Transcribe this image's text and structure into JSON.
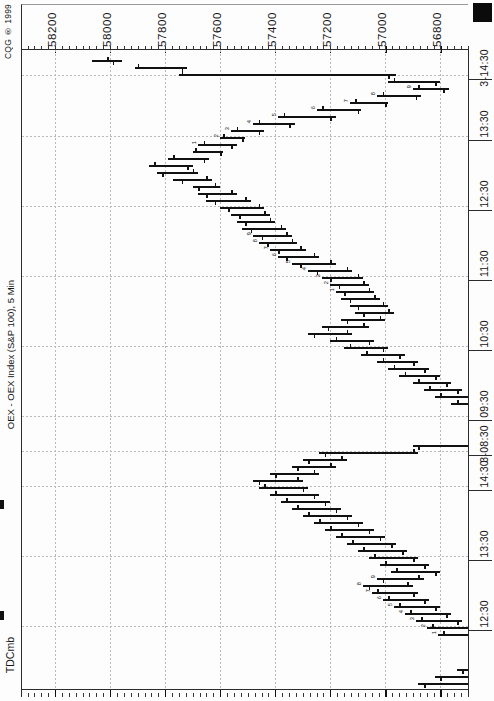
{
  "window": {
    "copyright": "CQG ® 1999",
    "series_label": "OEX - OEX Index (S&P 100), 5 Min",
    "study_label": "TDCmb",
    "corner_marker": "black-square-marker"
  },
  "chart_data": {
    "type": "bar",
    "subtype": "ohlc-bar-chart-rotated-90",
    "title": "OEX - OEX Index (S&P 100), 5 Min",
    "xlabel": "",
    "ylabel": "",
    "grid": true,
    "legend": "none",
    "orientation": "horizontal-price-axis-top",
    "price_axis": {
      "labels": [
        "58200",
        "58000",
        "57800",
        "57600",
        "57400",
        "57200",
        "57000",
        "56800"
      ],
      "values": [
        58200,
        58000,
        57800,
        57600,
        57400,
        57200,
        57000,
        56800
      ],
      "positions_px": [
        45,
        100,
        155,
        210,
        265,
        320,
        375,
        430
      ],
      "range": [
        56700,
        58320
      ],
      "minor_tick_interval": 25
    },
    "time_axis": {
      "labels": [
        "12:30",
        "13:30",
        "14:30",
        "3-08:30",
        "09:30",
        "10:30",
        "11:30",
        "12:30",
        "13:30",
        "3-14:30"
      ],
      "positions_px": [
        626,
        556,
        486,
        451,
        416,
        346,
        276,
        206,
        136,
        75
      ],
      "direction": "bottom-to-top"
    },
    "bars": [
      {
        "t": 60,
        "high": 58065,
        "low": 57955,
        "open": 58010,
        "close": 57990,
        "count": ""
      },
      {
        "t": 67,
        "high": 57910,
        "low": 57720,
        "open": 57900,
        "close": 57740,
        "count": ""
      },
      {
        "t": 74,
        "high": 57750,
        "low": 56960,
        "open": 57740,
        "close": 56990,
        "count": ""
      },
      {
        "t": 81,
        "high": 56990,
        "low": 56800,
        "open": 56970,
        "close": 56820,
        "count": ""
      },
      {
        "t": 88,
        "high": 56900,
        "low": 56770,
        "open": 56880,
        "close": 56790,
        "count": "9"
      },
      {
        "t": 95,
        "high": 57030,
        "low": 56870,
        "open": 57010,
        "close": 56890,
        "count": "8"
      },
      {
        "t": 102,
        "high": 57130,
        "low": 56990,
        "open": 57110,
        "close": 57000,
        "count": "7"
      },
      {
        "t": 109,
        "high": 57250,
        "low": 57090,
        "open": 57230,
        "close": 57100,
        "count": "6"
      },
      {
        "t": 116,
        "high": 57390,
        "low": 57180,
        "open": 57370,
        "close": 57200,
        "count": "5"
      },
      {
        "t": 123,
        "high": 57480,
        "low": 57330,
        "open": 57460,
        "close": 57350,
        "count": "4"
      },
      {
        "t": 130,
        "high": 57560,
        "low": 57440,
        "open": 57540,
        "close": 57460,
        "count": "3"
      },
      {
        "t": 137,
        "high": 57600,
        "low": 57510,
        "open": 57590,
        "close": 57520,
        "count": "2"
      },
      {
        "t": 144,
        "high": 57680,
        "low": 57540,
        "open": 57660,
        "close": 57560,
        "count": "1"
      },
      {
        "t": 151,
        "high": 57700,
        "low": 57590,
        "open": 57690,
        "close": 57600,
        "count": ""
      },
      {
        "t": 158,
        "high": 57790,
        "low": 57640,
        "open": 57770,
        "close": 57660,
        "count": ""
      },
      {
        "t": 165,
        "high": 57860,
        "low": 57700,
        "open": 57840,
        "close": 57720,
        "count": ""
      },
      {
        "t": 172,
        "high": 57830,
        "low": 57680,
        "open": 57700,
        "close": 57810,
        "count": ""
      },
      {
        "t": 179,
        "high": 57770,
        "low": 57630,
        "open": 57650,
        "close": 57740,
        "count": ""
      },
      {
        "t": 186,
        "high": 57700,
        "low": 57600,
        "open": 57620,
        "close": 57680,
        "count": ""
      },
      {
        "t": 193,
        "high": 57680,
        "low": 57540,
        "open": 57560,
        "close": 57650,
        "count": ""
      },
      {
        "t": 200,
        "high": 57650,
        "low": 57490,
        "open": 57510,
        "close": 57620,
        "count": ""
      },
      {
        "t": 207,
        "high": 57600,
        "low": 57440,
        "open": 57460,
        "close": 57570,
        "count": ""
      },
      {
        "t": 214,
        "high": 57560,
        "low": 57420,
        "open": 57440,
        "close": 57530,
        "count": ""
      },
      {
        "t": 221,
        "high": 57540,
        "low": 57400,
        "open": 57420,
        "close": 57510,
        "count": ""
      },
      {
        "t": 228,
        "high": 57520,
        "low": 57360,
        "open": 57380,
        "close": 57490,
        "count": ""
      },
      {
        "t": 235,
        "high": 57480,
        "low": 57340,
        "open": 57360,
        "close": 57450,
        "count": "9"
      },
      {
        "t": 242,
        "high": 57460,
        "low": 57320,
        "open": 57340,
        "close": 57430,
        "count": "8"
      },
      {
        "t": 249,
        "high": 57420,
        "low": 57290,
        "open": 57310,
        "close": 57390,
        "count": "7"
      },
      {
        "t": 256,
        "high": 57390,
        "low": 57240,
        "open": 57260,
        "close": 57360,
        "count": "6"
      },
      {
        "t": 263,
        "high": 57340,
        "low": 57180,
        "open": 57200,
        "close": 57310,
        "count": "5"
      },
      {
        "t": 270,
        "high": 57280,
        "low": 57120,
        "open": 57140,
        "close": 57250,
        "count": "4"
      },
      {
        "t": 277,
        "high": 57230,
        "low": 57080,
        "open": 57100,
        "close": 57200,
        "count": "3"
      },
      {
        "t": 284,
        "high": 57200,
        "low": 57060,
        "open": 57080,
        "close": 57170,
        "count": "2"
      },
      {
        "t": 291,
        "high": 57180,
        "low": 57040,
        "open": 57060,
        "close": 57150,
        "count": "1"
      },
      {
        "t": 298,
        "high": 57160,
        "low": 57020,
        "open": 57040,
        "close": 57130,
        "count": ""
      },
      {
        "t": 305,
        "high": 57130,
        "low": 56990,
        "open": 57010,
        "close": 57100,
        "count": ""
      },
      {
        "t": 312,
        "high": 57110,
        "low": 56970,
        "open": 56990,
        "close": 57080,
        "count": ""
      },
      {
        "t": 319,
        "high": 57160,
        "low": 57000,
        "open": 57020,
        "close": 57140,
        "count": ""
      },
      {
        "t": 326,
        "high": 57230,
        "low": 57060,
        "open": 57080,
        "close": 57210,
        "count": ""
      },
      {
        "t": 333,
        "high": 57280,
        "low": 57120,
        "open": 57140,
        "close": 57260,
        "count": ""
      },
      {
        "t": 340,
        "high": 57200,
        "low": 57040,
        "open": 57180,
        "close": 57060,
        "count": ""
      },
      {
        "t": 347,
        "high": 57150,
        "low": 56990,
        "open": 57130,
        "close": 57010,
        "count": ""
      },
      {
        "t": 354,
        "high": 57090,
        "low": 56930,
        "open": 57070,
        "close": 56950,
        "count": ""
      },
      {
        "t": 361,
        "high": 57030,
        "low": 56880,
        "open": 57010,
        "close": 56900,
        "count": ""
      },
      {
        "t": 368,
        "high": 56990,
        "low": 56840,
        "open": 56970,
        "close": 56860,
        "count": ""
      },
      {
        "t": 375,
        "high": 56950,
        "low": 56800,
        "open": 56930,
        "close": 56820,
        "count": ""
      },
      {
        "t": 382,
        "high": 56900,
        "low": 56760,
        "open": 56880,
        "close": 56780,
        "count": ""
      },
      {
        "t": 389,
        "high": 56860,
        "low": 56720,
        "open": 56840,
        "close": 56740,
        "count": ""
      },
      {
        "t": 396,
        "high": 56820,
        "low": 56680,
        "open": 56800,
        "close": 56700,
        "count": ""
      },
      {
        "t": 403,
        "high": 56760,
        "low": 56620,
        "open": 56740,
        "close": 56640,
        "count": ""
      },
      {
        "t": 410,
        "high": 56700,
        "low": 56560,
        "open": 56680,
        "close": 56580,
        "count": ""
      },
      {
        "t": 417,
        "high": 56660,
        "low": 56520,
        "open": 56640,
        "close": 56540,
        "count": ""
      },
      {
        "t": 424,
        "high": 56620,
        "low": 56340,
        "open": 56600,
        "close": 56360,
        "count": ""
      },
      {
        "t": 431,
        "high": 56420,
        "low": 56280,
        "open": 56400,
        "close": 56300,
        "count": ""
      },
      {
        "t": 438,
        "high": 56560,
        "low": 56300,
        "open": 56320,
        "close": 56540,
        "count": ""
      },
      {
        "t": 445,
        "high": 56900,
        "low": 56540,
        "open": 56560,
        "close": 56880,
        "count": ""
      },
      {
        "t": 452,
        "high": 57240,
        "low": 56880,
        "open": 56900,
        "close": 57220,
        "count": ""
      },
      {
        "t": 459,
        "high": 57300,
        "low": 57140,
        "open": 57160,
        "close": 57280,
        "count": ""
      },
      {
        "t": 466,
        "high": 57340,
        "low": 57180,
        "open": 57200,
        "close": 57320,
        "count": ""
      },
      {
        "t": 473,
        "high": 57420,
        "low": 57240,
        "open": 57260,
        "close": 57400,
        "count": ""
      },
      {
        "t": 480,
        "high": 57480,
        "low": 57300,
        "open": 57320,
        "close": 57460,
        "count": ""
      },
      {
        "t": 487,
        "high": 57460,
        "low": 57280,
        "open": 57440,
        "close": 57300,
        "count": ""
      },
      {
        "t": 494,
        "high": 57420,
        "low": 57240,
        "open": 57400,
        "close": 57260,
        "count": ""
      },
      {
        "t": 501,
        "high": 57380,
        "low": 57200,
        "open": 57360,
        "close": 57220,
        "count": ""
      },
      {
        "t": 508,
        "high": 57340,
        "low": 57160,
        "open": 57320,
        "close": 57180,
        "count": ""
      },
      {
        "t": 515,
        "high": 57300,
        "low": 57120,
        "open": 57280,
        "close": 57140,
        "count": ""
      },
      {
        "t": 522,
        "high": 57260,
        "low": 57080,
        "open": 57240,
        "close": 57100,
        "count": ""
      },
      {
        "t": 529,
        "high": 57220,
        "low": 57040,
        "open": 57200,
        "close": 57060,
        "count": ""
      },
      {
        "t": 536,
        "high": 57180,
        "low": 57000,
        "open": 57160,
        "close": 57020,
        "count": ""
      },
      {
        "t": 543,
        "high": 57140,
        "low": 56960,
        "open": 57120,
        "close": 56980,
        "count": ""
      },
      {
        "t": 550,
        "high": 57100,
        "low": 56920,
        "open": 57080,
        "close": 56940,
        "count": ""
      },
      {
        "t": 557,
        "high": 57060,
        "low": 56880,
        "open": 57040,
        "close": 56900,
        "count": ""
      },
      {
        "t": 564,
        "high": 57020,
        "low": 56840,
        "open": 57000,
        "close": 56860,
        "count": ""
      },
      {
        "t": 571,
        "high": 56980,
        "low": 56800,
        "open": 56960,
        "close": 56820,
        "count": ""
      },
      {
        "t": 578,
        "high": 57030,
        "low": 56860,
        "open": 56880,
        "close": 57010,
        "count": "9"
      },
      {
        "t": 585,
        "high": 57080,
        "low": 56900,
        "open": 56920,
        "close": 57060,
        "count": "8"
      },
      {
        "t": 592,
        "high": 57050,
        "low": 56880,
        "open": 57030,
        "close": 56900,
        "count": "7"
      },
      {
        "t": 599,
        "high": 57010,
        "low": 56840,
        "open": 56990,
        "close": 56860,
        "count": "6"
      },
      {
        "t": 606,
        "high": 56970,
        "low": 56800,
        "open": 56950,
        "close": 56820,
        "count": "5"
      },
      {
        "t": 613,
        "high": 56930,
        "low": 56760,
        "open": 56910,
        "close": 56780,
        "count": "4"
      },
      {
        "t": 620,
        "high": 56890,
        "low": 56720,
        "open": 56870,
        "close": 56740,
        "count": "3"
      },
      {
        "t": 627,
        "high": 56850,
        "low": 56660,
        "open": 56830,
        "close": 56680,
        "count": "2"
      },
      {
        "t": 634,
        "high": 56810,
        "low": 56600,
        "open": 56790,
        "close": 56620,
        "count": "1"
      },
      {
        "t": 641,
        "high": 56700,
        "low": 56540,
        "open": 56680,
        "close": 56560,
        "count": ""
      },
      {
        "t": 648,
        "high": 56660,
        "low": 56500,
        "open": 56640,
        "close": 56520,
        "count": ""
      },
      {
        "t": 655,
        "high": 56620,
        "low": 56460,
        "open": 56600,
        "close": 56480,
        "count": ""
      },
      {
        "t": 662,
        "high": 56700,
        "low": 56480,
        "open": 56500,
        "close": 56680,
        "count": ""
      },
      {
        "t": 669,
        "high": 56740,
        "low": 56520,
        "open": 56540,
        "close": 56720,
        "count": ""
      },
      {
        "t": 676,
        "high": 56820,
        "low": 56560,
        "open": 56580,
        "close": 56800,
        "count": ""
      },
      {
        "t": 683,
        "high": 56880,
        "low": 56620,
        "open": 56640,
        "close": 56860,
        "count": ""
      }
    ]
  }
}
